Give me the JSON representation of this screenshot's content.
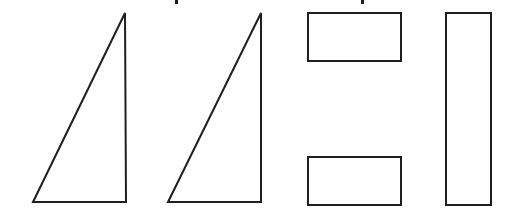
{
  "figure": {
    "background": "#ffffff",
    "stroke_color": "#1e1e1e",
    "stroke_width": 2,
    "caption_partial": "cropped text at top edge (only descenders visible)",
    "shapes": [
      {
        "id": "triangle-1",
        "type": "right-triangle",
        "points": [
          [
            33,
            202
          ],
          [
            125,
            13
          ],
          [
            126,
            202
          ]
        ]
      },
      {
        "id": "triangle-2",
        "type": "right-triangle",
        "points": [
          [
            168,
            202
          ],
          [
            261,
            13
          ],
          [
            261,
            202
          ]
        ]
      },
      {
        "id": "rectangle-top",
        "type": "rectangle",
        "x": 308,
        "y": 13,
        "width": 93,
        "height": 48
      },
      {
        "id": "rectangle-bottom",
        "type": "rectangle",
        "x": 308,
        "y": 157,
        "width": 93,
        "height": 48
      },
      {
        "id": "rectangle-tall",
        "type": "rectangle",
        "x": 446,
        "y": 13,
        "width": 45,
        "height": 192
      }
    ]
  }
}
